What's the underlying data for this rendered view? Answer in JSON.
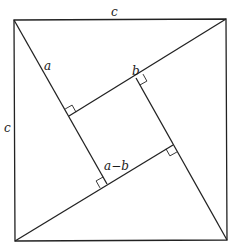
{
  "diagram": {
    "labels": {
      "top_side": "c",
      "left_side": "c",
      "leg_a": "a",
      "leg_b": "b",
      "inner_side": "a−b"
    },
    "outer_square": {
      "top_left": [
        14,
        20
      ],
      "top_right": [
        226,
        19
      ],
      "bottom_right": [
        227,
        240
      ],
      "bottom_left": [
        15,
        241
      ]
    },
    "inner_square": {
      "top_left": [
        69,
        116
      ],
      "top_right": [
        136,
        78
      ],
      "bottom_right": [
        173,
        145
      ],
      "bottom_left": [
        107,
        184
      ]
    },
    "colors": {
      "stroke": "#222222",
      "background": "#ffffff",
      "text": "#1a1a1a"
    }
  }
}
